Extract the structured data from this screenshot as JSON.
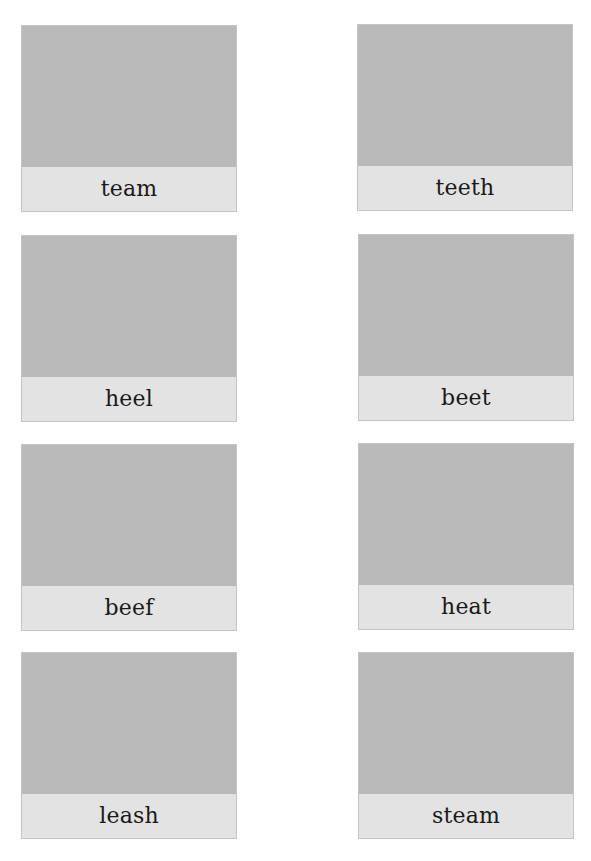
{
  "worksheet": {
    "cards": [
      {
        "word": "team",
        "image": "picture-placeholder"
      },
      {
        "word": "teeth",
        "image": "picture-placeholder"
      },
      {
        "word": "heel",
        "image": "picture-placeholder"
      },
      {
        "word": "beet",
        "image": "picture-placeholder"
      },
      {
        "word": "beef",
        "image": "picture-placeholder"
      },
      {
        "word": "heat",
        "image": "picture-placeholder"
      },
      {
        "word": "leash",
        "image": "picture-placeholder"
      },
      {
        "word": "steam",
        "image": "picture-placeholder"
      }
    ]
  },
  "colors": {
    "picture_fill": "#b9b9b9",
    "label_fill": "#e3e3e3",
    "border": "#c4c4c4",
    "text": "#1a1a1a"
  }
}
